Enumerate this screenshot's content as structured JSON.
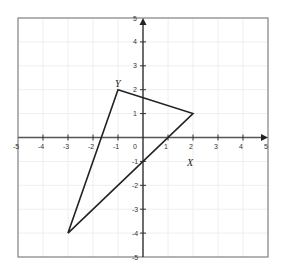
{
  "chart_data": {
    "type": "scatter",
    "title": "",
    "xlabel": "",
    "ylabel": "",
    "xlim": [
      -5,
      5
    ],
    "ylim": [
      -5,
      5
    ],
    "grid": true,
    "x_ticks": [
      -5,
      -4,
      -3,
      -2,
      -1,
      0,
      1,
      2,
      3,
      4,
      5
    ],
    "y_ticks": [
      -5,
      -4,
      -3,
      -2,
      -1,
      1,
      2,
      3,
      4,
      5
    ],
    "x_tick_labels": [
      "-5",
      "-4",
      "-3",
      "-2",
      "-1",
      "0",
      "1",
      "2",
      "3",
      "4",
      "5"
    ],
    "y_tick_labels": [
      "-5",
      "-4",
      "-3",
      "-2",
      "-1",
      "1",
      "2",
      "3",
      "4",
      "5"
    ],
    "series": [
      {
        "name": "triangle",
        "shape": "polygon",
        "points": [
          [
            -1,
            2
          ],
          [
            2,
            1
          ],
          [
            -3,
            -4
          ]
        ]
      }
    ],
    "annotations": [
      {
        "text": "Y",
        "x": -1,
        "y": 2
      },
      {
        "text": "X",
        "x": 2,
        "y": 1
      }
    ],
    "colors": {
      "frame": "#808080",
      "grid": "#eeeeee",
      "axis": "#555555",
      "polygon": "#222222"
    }
  }
}
